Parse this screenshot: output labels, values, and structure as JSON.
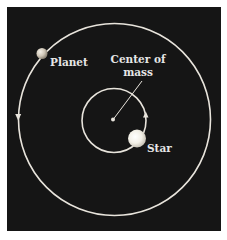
{
  "diagram": {
    "labels": {
      "planet": "Planet",
      "center_line1": "Center of",
      "center_line2": "mass",
      "star": "Star"
    },
    "colors": {
      "background": "#ffffff",
      "panel": "#151515",
      "orbit": "#e8e4dc",
      "text": "#e6e6e6",
      "star": "#f4f1e8",
      "planet": "#d9d2c4"
    },
    "orbits": [
      {
        "name": "planet-orbit",
        "direction": "counterclockwise"
      },
      {
        "name": "star-orbit",
        "direction": "counterclockwise"
      }
    ]
  }
}
